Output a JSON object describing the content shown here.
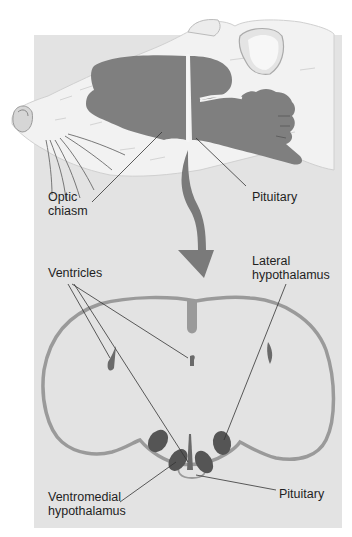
{
  "figure": {
    "colors": {
      "panel": "#e3e3e3",
      "fur": "#f2f2f2",
      "brain": "#7f7f7f",
      "outline": "#9a9a9a",
      "arrow": "#7a7a7a",
      "nucleus": "#555555",
      "leader": "#333333"
    },
    "labels": {
      "optic_chiasm": "Optic\nchiasm",
      "pituitary_top": "Pituitary",
      "ventricles": "Ventricles",
      "lateral_hypothalamus": "Lateral\nhypothalamus",
      "ventromedial_hypothalamus": "Ventromedial\nhypothalamus",
      "pituitary_bottom": "Pituitary"
    }
  }
}
